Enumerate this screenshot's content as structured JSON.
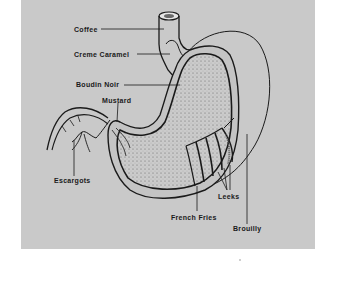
{
  "diagram": {
    "background_color": "#c9c9c9",
    "labels": [
      {
        "id": "coffee",
        "text": "Coffee"
      },
      {
        "id": "creme_caramel",
        "text": "Creme Caramel"
      },
      {
        "id": "boudin_noir",
        "text": "Boudin Noir"
      },
      {
        "id": "mustard",
        "text": "Mustard"
      },
      {
        "id": "escargots",
        "text": "Escargots"
      },
      {
        "id": "leeks",
        "text": "Leeks"
      },
      {
        "id": "french_fries",
        "text": "French Fries"
      },
      {
        "id": "brouilly",
        "text": "Brouilly"
      }
    ]
  }
}
